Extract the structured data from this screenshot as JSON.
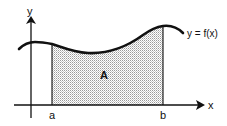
{
  "diagram": {
    "type": "area-under-curve",
    "labels": {
      "y_axis": "y",
      "x_axis": "x",
      "curve": "y = f(x)",
      "area": "A",
      "lower_bound": "a",
      "upper_bound": "b"
    },
    "colors": {
      "stroke": "#111111",
      "fill_dots": "#9a9a9a",
      "background": "#ffffff"
    }
  }
}
